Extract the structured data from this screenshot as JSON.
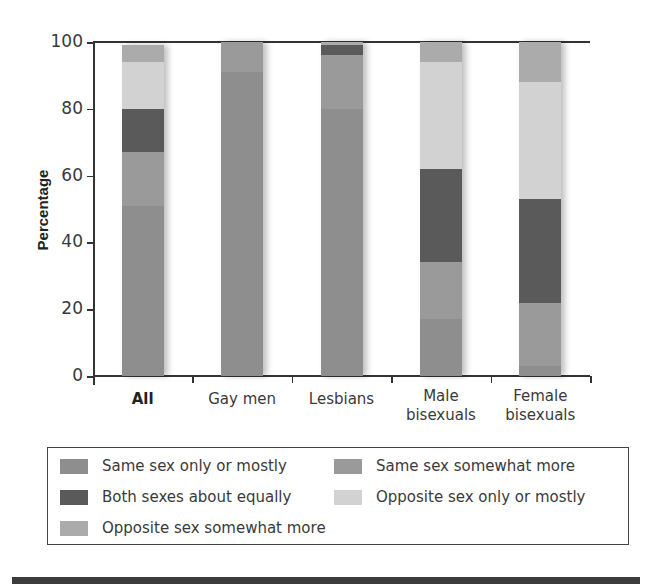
{
  "chart_data": {
    "type": "bar",
    "stacked": true,
    "title": "",
    "xlabel": "",
    "ylabel": "Percentage",
    "ylim": [
      0,
      100
    ],
    "yticks": [
      0,
      20,
      40,
      60,
      80,
      100
    ],
    "grid": false,
    "legend_position": "bottom",
    "categories": [
      "All",
      "Gay men",
      "Lesbians",
      "Male bisexuals",
      "Female bisexuals"
    ],
    "category_lines": [
      [
        "All"
      ],
      [
        "Gay men"
      ],
      [
        "Lesbians"
      ],
      [
        "Male",
        "bisexuals"
      ],
      [
        "Female",
        "bisexuals"
      ]
    ],
    "series": [
      {
        "name": "Same sex only or mostly",
        "color": "#8e8e8e",
        "values": [
          51,
          91,
          80,
          17,
          3
        ]
      },
      {
        "name": "Same sex somewhat more",
        "color": "#9a9a9a",
        "values": [
          16,
          9,
          16,
          17,
          19
        ]
      },
      {
        "name": "Both sexes about equally",
        "color": "#5a5a5a",
        "values": [
          13,
          0,
          3,
          28,
          31
        ]
      },
      {
        "name": "Opposite sex only or mostly",
        "color": "#d2d2d2",
        "values": [
          14,
          0,
          0,
          32,
          35
        ]
      },
      {
        "name": "Opposite sex somewhat more",
        "color": "#ababab",
        "values": [
          5,
          0,
          1,
          6,
          12
        ]
      }
    ]
  },
  "legend": {
    "items": [
      {
        "label": "Same sex only or mostly",
        "color": "#8e8e8e"
      },
      {
        "label": "Same sex somewhat more",
        "color": "#9a9a9a"
      },
      {
        "label": "Both sexes about equally",
        "color": "#5a5a5a"
      },
      {
        "label": "Opposite sex only or mostly",
        "color": "#d2d2d2"
      },
      {
        "label": "Opposite sex somewhat more",
        "color": "#ababab"
      }
    ]
  },
  "axis": {
    "ylabel": "Percentage",
    "ytick_labels": [
      "0",
      "20",
      "40",
      "60",
      "80",
      "100"
    ]
  }
}
